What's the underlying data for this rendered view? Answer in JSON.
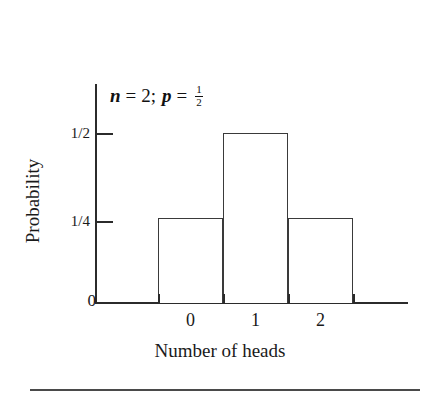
{
  "chart_data": {
    "type": "bar",
    "title": "",
    "annotation": {
      "n_var": "n",
      "equals": "=",
      "n_value": "2",
      "separator": ";",
      "p_var": "p",
      "p_numerator": "1",
      "p_denominator": "2",
      "full_text": "n = 2; p = 1/2"
    },
    "categories": [
      "0",
      "1",
      "2"
    ],
    "values": [
      0.25,
      0.5,
      0.25
    ],
    "value_labels": [
      "1/4",
      "1/2",
      "1/4"
    ],
    "xlabel": "Number of heads",
    "ylabel": "Probability",
    "ylim": [
      0,
      0.625
    ],
    "xlim": [
      -0.5,
      2.5
    ],
    "ytick_labels": [
      "0",
      "1/4",
      "1/2"
    ],
    "ytick_values": [
      0,
      0.25,
      0.5
    ],
    "xtick_labels": [
      "0",
      "1",
      "2"
    ],
    "grid": false,
    "legend": false,
    "bar_fill_color": "#ffffff",
    "bar_edge_color": "#3a3a3a",
    "axis_color": "#2b2b2b",
    "text_color": "#1a1a1a",
    "background_color": "#ffffff"
  }
}
